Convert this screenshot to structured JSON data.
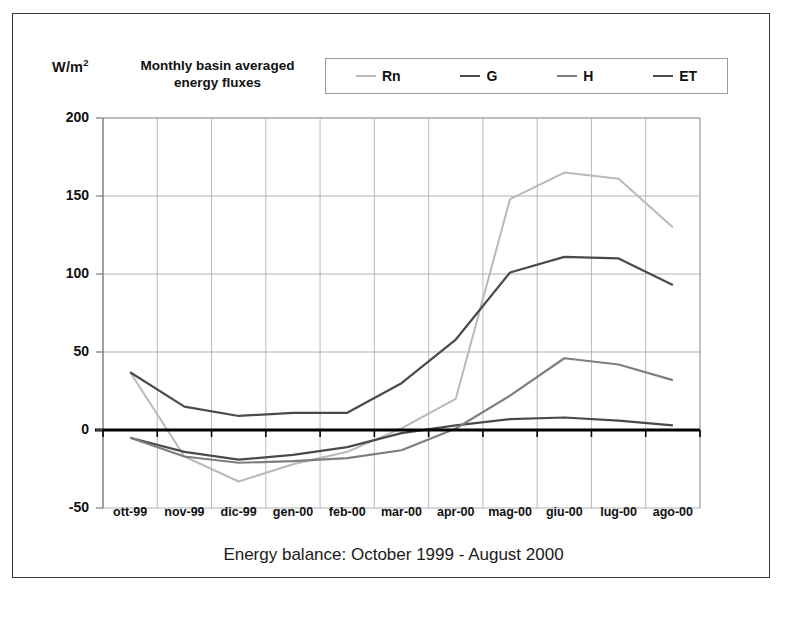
{
  "figure": {
    "unit_label": "W/m",
    "unit_exponent": "2",
    "title_line1": "Monthly basin averaged",
    "title_line2": "energy fluxes",
    "caption": "Energy balance: October 1999 - August 2000"
  },
  "legend": {
    "position": "top",
    "entries": [
      {
        "label": "Rn",
        "color": "#b9b9b9"
      },
      {
        "label": "G",
        "color": "#4a4a4a"
      },
      {
        "label": "H",
        "color": "#7e7e7e"
      },
      {
        "label": "ET",
        "color": "#4a4a4a"
      }
    ]
  },
  "axes": {
    "y_ticks": [
      "200",
      "150",
      "100",
      "50",
      "0",
      "-50"
    ],
    "x_ticks": [
      "ott-99",
      "nov-99",
      "dic-99",
      "gen-00",
      "feb-00",
      "mar-00",
      "apr-00",
      "mag-00",
      "giu-00",
      "lug-00",
      "ago-00"
    ]
  },
  "chart_data": {
    "type": "line",
    "title": "Monthly basin averaged energy fluxes",
    "xlabel": "Energy balance: October 1999 - August 2000",
    "ylabel": "W/m2",
    "ylim": [
      -50,
      200
    ],
    "ytick_step": 50,
    "grid": true,
    "legend_position": "top",
    "categories": [
      "ott-99",
      "nov-99",
      "dic-99",
      "gen-00",
      "feb-00",
      "mar-00",
      "apr-00",
      "mag-00",
      "giu-00",
      "lug-00",
      "ago-00"
    ],
    "series": [
      {
        "name": "Rn",
        "color": "#b9b9b9",
        "values": [
          37,
          -17,
          -33,
          -22,
          -14,
          1,
          20,
          148,
          165,
          161,
          130
        ]
      },
      {
        "name": "G",
        "color": "#4a4a4a",
        "values": [
          -5,
          -14,
          -19,
          -16,
          -11,
          -2,
          3,
          7,
          8,
          6,
          3
        ]
      },
      {
        "name": "H",
        "color": "#7e7e7e",
        "values": [
          -5,
          -17,
          -21,
          -20,
          -18,
          -13,
          1,
          22,
          46,
          42,
          32
        ]
      },
      {
        "name": "ET",
        "color": "#4a4a4a",
        "values": [
          37,
          15,
          9,
          11,
          11,
          30,
          58,
          101,
          111,
          110,
          93
        ]
      }
    ]
  }
}
